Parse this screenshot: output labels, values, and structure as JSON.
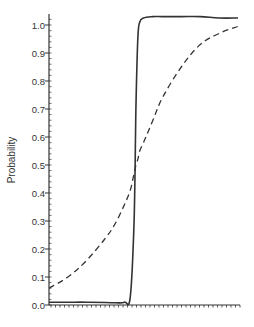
{
  "chart_data": {
    "type": "line",
    "title": "",
    "xlabel": "",
    "ylabel": "Probability",
    "ylim": [
      0.0,
      1.03
    ],
    "yticks": [
      "0.0",
      "0.1",
      "0.2",
      "0.3",
      "0.4",
      "0.5",
      "0.6",
      "0.7",
      "0.8",
      "0.9",
      "1.0"
    ],
    "xticks_labeled": false,
    "grid": false,
    "legend": null,
    "x": [
      0,
      0.1,
      0.2,
      0.3,
      0.35,
      0.4,
      0.43,
      0.45,
      0.46,
      0.47,
      0.48,
      0.5,
      0.55,
      0.6,
      0.7,
      0.8,
      0.9,
      1.0
    ],
    "series": [
      {
        "name": "steep (solid)",
        "style": "solid",
        "values": [
          0.01,
          0.01,
          0.01,
          0.009,
          0.008,
          0.01,
          0.03,
          0.3,
          0.7,
          0.95,
          1.01,
          1.025,
          1.03,
          1.03,
          1.03,
          1.03,
          1.025,
          1.025
        ]
      },
      {
        "name": "gradual (dashed)",
        "style": "dashed",
        "values": [
          0.06,
          0.1,
          0.16,
          0.24,
          0.29,
          0.36,
          0.41,
          0.47,
          0.5,
          0.52,
          0.55,
          0.58,
          0.66,
          0.74,
          0.85,
          0.93,
          0.97,
          0.995
        ]
      }
    ]
  }
}
